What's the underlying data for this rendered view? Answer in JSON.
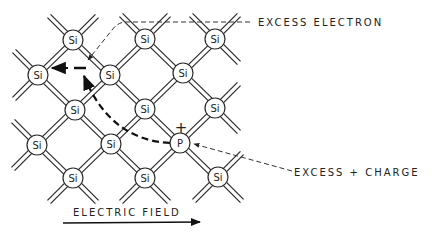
{
  "diagram": {
    "lattice_atoms": [
      {
        "id": "a1",
        "symbol": "Si"
      },
      {
        "id": "a2",
        "symbol": "Si"
      },
      {
        "id": "a3",
        "symbol": "Si"
      },
      {
        "id": "a4",
        "symbol": "Si"
      },
      {
        "id": "a5",
        "symbol": "Si"
      },
      {
        "id": "a6",
        "symbol": "Si"
      },
      {
        "id": "a7",
        "symbol": "Si"
      },
      {
        "id": "a8",
        "symbol": "Si"
      },
      {
        "id": "a9",
        "symbol": "Si"
      },
      {
        "id": "a10",
        "symbol": "Si"
      },
      {
        "id": "a11",
        "symbol": "P"
      },
      {
        "id": "a12",
        "symbol": "Si"
      },
      {
        "id": "a13",
        "symbol": "Si"
      },
      {
        "id": "a14",
        "symbol": "Si"
      }
    ],
    "plus_sign": "+",
    "labels": {
      "excess_electron": "EXCESS ELECTRON",
      "excess_charge": "EXCESS + CHARGE",
      "electric_field": "ELECTRIC FIELD"
    }
  }
}
